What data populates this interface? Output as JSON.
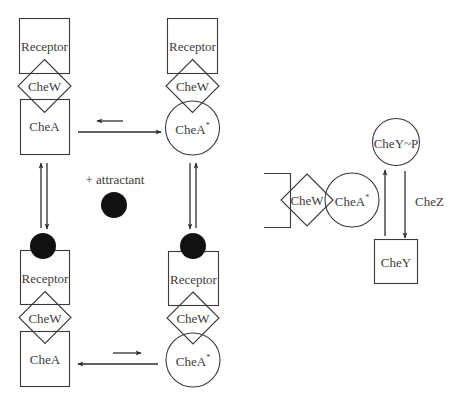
{
  "diagram": {
    "colors": {
      "stroke": "#3a3a3a",
      "text": "#3d3d3d",
      "attractant": "#111111",
      "background": "#ffffff"
    },
    "labels": {
      "receptor": "Receptor",
      "chew": "CheW",
      "chea": "CheA",
      "chea_active": "CheA",
      "active_mark": "*",
      "attractant": "+ attractant",
      "chey_p": "CheY~P",
      "chey": "CheY",
      "chez": "CheZ"
    },
    "panels": [
      {
        "id": "top-left",
        "state": "inactive",
        "bound_attractant": false,
        "components": [
          "Receptor",
          "CheW",
          "CheA"
        ]
      },
      {
        "id": "top-right",
        "state": "active",
        "bound_attractant": false,
        "components": [
          "Receptor",
          "CheW",
          "CheA*"
        ]
      },
      {
        "id": "bottom-left",
        "state": "inactive",
        "bound_attractant": true,
        "components": [
          "Receptor",
          "CheW",
          "CheA"
        ]
      },
      {
        "id": "bottom-right",
        "state": "active",
        "bound_attractant": true,
        "components": [
          "Receptor",
          "CheW",
          "CheA*"
        ]
      }
    ],
    "equilibria": [
      {
        "from": "top-left",
        "to": "top-right",
        "favored": "top-right"
      },
      {
        "from": "bottom-left",
        "to": "bottom-right",
        "favored": "bottom-left"
      },
      {
        "from": "top-left",
        "to": "bottom-left",
        "condition": "+ attractant"
      },
      {
        "from": "top-right",
        "to": "bottom-right",
        "condition": "+ attractant"
      }
    ],
    "phospho_cycle": {
      "kinase_complex": [
        "CheW",
        "CheA*"
      ],
      "substrate": "CheY",
      "product": "CheY~P",
      "phosphatase": "CheZ"
    }
  }
}
